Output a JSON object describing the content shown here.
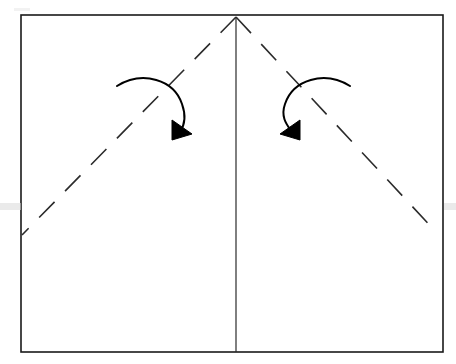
{
  "figure": {
    "background_color": "#ffffff",
    "stroke_color": "#1a1a1a",
    "arrow_color": "#000000",
    "paper": {
      "name": "paper-sheet",
      "x": 21,
      "y": 15,
      "width": 422,
      "height": 337,
      "stroke_width": 1.6,
      "fill": "#ffffff"
    },
    "center_crease": {
      "name": "vertical-center-crease",
      "x1": 236,
      "y1": 18,
      "x2": 236,
      "y2": 352,
      "stroke_width": 1.2,
      "style": "solid"
    },
    "fold_lines": [
      {
        "name": "left-diagonal-fold-line",
        "x1": 236,
        "y1": 17,
        "x2": 22,
        "y2": 235,
        "stroke_width": 1.6,
        "style": "dashed",
        "dash_length": 22,
        "dash_gap": 15
      },
      {
        "name": "right-diagonal-fold-line",
        "x1": 236,
        "y1": 17,
        "x2": 437,
        "y2": 233,
        "stroke_width": 1.6,
        "style": "dashed",
        "dash_length": 22,
        "dash_gap": 15
      }
    ],
    "arrows": [
      {
        "name": "left-fold-arrow",
        "direction": "clockwise",
        "path": "M 117 86 C 143 70, 174 80, 182 104 C 187 118, 184 126, 180 132",
        "head": "M 180 122 L 192 137 L 171 139 Z",
        "stroke_width": 2.0
      },
      {
        "name": "right-fold-arrow",
        "direction": "counter-clockwise",
        "path": "M 350 86 C 324 70, 293 80, 285 104 C 280 118, 288 126, 292 132",
        "head": "M 292 122 L 280 137 L 301 139 Z",
        "stroke_width": 2.0
      }
    ],
    "scan_artifacts": [
      {
        "name": "scan-artifact-left-band",
        "color": "#d9d9d9"
      },
      {
        "name": "scan-artifact-right-band",
        "color": "#d9d9d9"
      },
      {
        "name": "scan-artifact-top-left",
        "color": "#d9d9d9"
      }
    ]
  }
}
